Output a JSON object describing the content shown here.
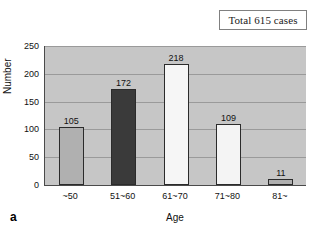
{
  "annotation": {
    "total_box_text": "Total 615 cases",
    "panel_letter": "a"
  },
  "chart_data": {
    "type": "bar",
    "title": "",
    "xlabel": "Age",
    "ylabel": "Number",
    "categories": [
      "~50",
      "51~60",
      "61~70",
      "71~80",
      "81~"
    ],
    "values": [
      105,
      172,
      218,
      109,
      11
    ],
    "value_labels": [
      "105",
      "172",
      "218",
      "109",
      "11"
    ],
    "ylim": [
      0,
      250
    ],
    "yticks": [
      0,
      50,
      100,
      150,
      200,
      250
    ],
    "ytick_labels": [
      "0",
      "50",
      "100",
      "150",
      "200",
      "250"
    ],
    "grid": true,
    "legend": "none",
    "annotation_text": "Total 615 cases",
    "total": 615,
    "bar_colors": [
      "#b0b0b0",
      "#3a3a3a",
      "#f6f6f6",
      "#f4f4f4",
      "#b0b0b0"
    ],
    "plot_background": "#c6c6c6",
    "axis_color": "#4a4a4a",
    "gridline_color": "#9a9a9a",
    "bar_edge_color": "#2b2b2b"
  }
}
